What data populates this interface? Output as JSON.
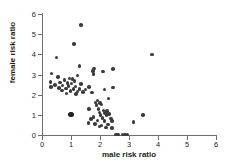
{
  "chart_data": {
    "type": "scatter",
    "title": "",
    "xlabel": "male risk ratio",
    "ylabel": "female risk ratio",
    "xlim": [
      0,
      6
    ],
    "ylim": [
      0,
      6
    ],
    "xticks": [
      0,
      1,
      2,
      3,
      4,
      5,
      6
    ],
    "yticks": [
      0,
      1,
      2,
      3,
      4,
      5,
      6
    ],
    "grid": false,
    "legend": null,
    "marker_color": "#3b3b3d",
    "axis_color": "#6d6e71",
    "points": [
      {
        "x": 1.35,
        "y": 5.45
      },
      {
        "x": 1.1,
        "y": 4.5
      },
      {
        "x": 3.8,
        "y": 4.0
      },
      {
        "x": 0.5,
        "y": 3.85
      },
      {
        "x": 1.3,
        "y": 3.42
      },
      {
        "x": 1.8,
        "y": 3.3
      },
      {
        "x": 2.45,
        "y": 3.28
      },
      {
        "x": 1.75,
        "y": 3.18
      },
      {
        "x": 2.1,
        "y": 3.15
      },
      {
        "x": 0.33,
        "y": 3.05
      },
      {
        "x": 1.78,
        "y": 3.02
      },
      {
        "x": 1.22,
        "y": 2.95
      },
      {
        "x": 0.55,
        "y": 2.88
      },
      {
        "x": 0.95,
        "y": 2.8
      },
      {
        "x": 1.05,
        "y": 2.78
      },
      {
        "x": 0.78,
        "y": 2.72
      },
      {
        "x": 1.12,
        "y": 2.68
      },
      {
        "x": 0.3,
        "y": 2.62
      },
      {
        "x": 0.62,
        "y": 2.6
      },
      {
        "x": 0.88,
        "y": 2.58
      },
      {
        "x": 1.02,
        "y": 2.55
      },
      {
        "x": 1.35,
        "y": 2.52
      },
      {
        "x": 0.45,
        "y": 2.48
      },
      {
        "x": 0.7,
        "y": 2.45
      },
      {
        "x": 0.92,
        "y": 2.42
      },
      {
        "x": 1.15,
        "y": 2.4
      },
      {
        "x": 0.32,
        "y": 2.38
      },
      {
        "x": 1.62,
        "y": 2.38
      },
      {
        "x": 2.45,
        "y": 2.35
      },
      {
        "x": 0.58,
        "y": 2.32
      },
      {
        "x": 0.82,
        "y": 2.3
      },
      {
        "x": 1.08,
        "y": 2.28
      },
      {
        "x": 1.3,
        "y": 2.28
      },
      {
        "x": 1.5,
        "y": 2.26
      },
      {
        "x": 2.15,
        "y": 2.25
      },
      {
        "x": 0.68,
        "y": 2.2
      },
      {
        "x": 0.98,
        "y": 2.18
      },
      {
        "x": 1.22,
        "y": 2.15
      },
      {
        "x": 1.42,
        "y": 2.12
      },
      {
        "x": 1.72,
        "y": 2.1
      },
      {
        "x": 0.85,
        "y": 2.05
      },
      {
        "x": 1.18,
        "y": 2.02
      },
      {
        "x": 2.3,
        "y": 1.8
      },
      {
        "x": 1.92,
        "y": 1.72
      },
      {
        "x": 1.85,
        "y": 1.62
      },
      {
        "x": 2.0,
        "y": 1.58
      },
      {
        "x": 2.05,
        "y": 1.52
      },
      {
        "x": 1.88,
        "y": 1.48
      },
      {
        "x": 1.62,
        "y": 1.3
      },
      {
        "x": 1.95,
        "y": 1.28
      },
      {
        "x": 2.12,
        "y": 1.22
      },
      {
        "x": 2.25,
        "y": 1.18
      },
      {
        "x": 1.98,
        "y": 1.12
      },
      {
        "x": 2.18,
        "y": 1.1
      },
      {
        "x": 2.32,
        "y": 1.05
      },
      {
        "x": 2.02,
        "y": 1.0
      },
      {
        "x": 2.22,
        "y": 0.98
      },
      {
        "x": 3.48,
        "y": 0.98
      },
      {
        "x": 1.0,
        "y": 1.0,
        "big": true
      },
      {
        "x": 1.78,
        "y": 0.88
      },
      {
        "x": 2.08,
        "y": 0.85
      },
      {
        "x": 2.38,
        "y": 0.82
      },
      {
        "x": 1.68,
        "y": 0.78
      },
      {
        "x": 1.92,
        "y": 0.72
      },
      {
        "x": 2.15,
        "y": 0.7
      },
      {
        "x": 2.42,
        "y": 0.68
      },
      {
        "x": 3.15,
        "y": 0.65
      },
      {
        "x": 1.6,
        "y": 0.6
      },
      {
        "x": 1.82,
        "y": 0.55
      },
      {
        "x": 2.28,
        "y": 0.52
      },
      {
        "x": 2.05,
        "y": 0.48
      },
      {
        "x": 1.98,
        "y": 0.42
      },
      {
        "x": 2.2,
        "y": 0.38
      },
      {
        "x": 2.42,
        "y": 0.35
      },
      {
        "x": 2.55,
        "y": 0.02
      },
      {
        "x": 2.62,
        "y": 0.02
      },
      {
        "x": 2.78,
        "y": 0.02
      },
      {
        "x": 2.86,
        "y": 0.02
      },
      {
        "x": 2.95,
        "y": 0.02
      }
    ]
  }
}
